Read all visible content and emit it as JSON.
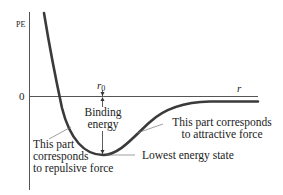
{
  "diagram": {
    "axes": {
      "y_label": "PE",
      "zero_label": "0",
      "x_label": "r",
      "r0_label": "r",
      "r0_subscript": "0"
    },
    "annotations": {
      "binding_energy_line1": "Binding",
      "binding_energy_line2": "energy",
      "repulsive_line1": "This part",
      "repulsive_line2": "corresponds",
      "repulsive_line3": "to repulsive force",
      "attractive_line1": "This part corresponds",
      "attractive_line2": "to attractive force",
      "lowest_energy": "Lowest energy state"
    },
    "colors": {
      "curve": "#3a3a3a",
      "axis": "#555555",
      "text": "#222222"
    }
  }
}
